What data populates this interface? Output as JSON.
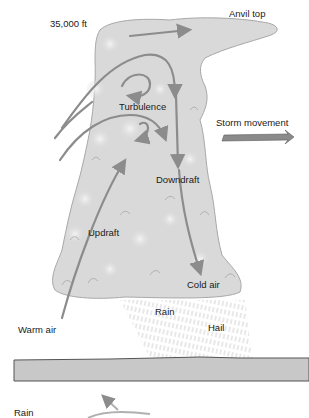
{
  "diagram": {
    "type": "thunderstorm cross-section",
    "colors": {
      "cloud_fill": "#d9d9d9",
      "cloud_shadow": "#bdbdbd",
      "cloud_edge": "#a8a8a8",
      "airflow_arrow": "#8c8c8c",
      "storm_arrow": "#8a8a8a",
      "ground_fill": "#c8c8c8",
      "ground_edge": "#555555",
      "precip": "#b0b0b0",
      "text": "#1a1a1a"
    },
    "labels": {
      "altitude": "35,000 ft",
      "anvil_top": "Anvil top",
      "turbulence": "Turbulence",
      "storm_movement": "Storm movement",
      "downdraft": "Downdraft",
      "updraft": "Updraft",
      "cold_air": "Cold air",
      "warm_air": "Warm air",
      "rain": "Rain",
      "hail": "Hail",
      "rain_bottom": "Rain"
    }
  }
}
